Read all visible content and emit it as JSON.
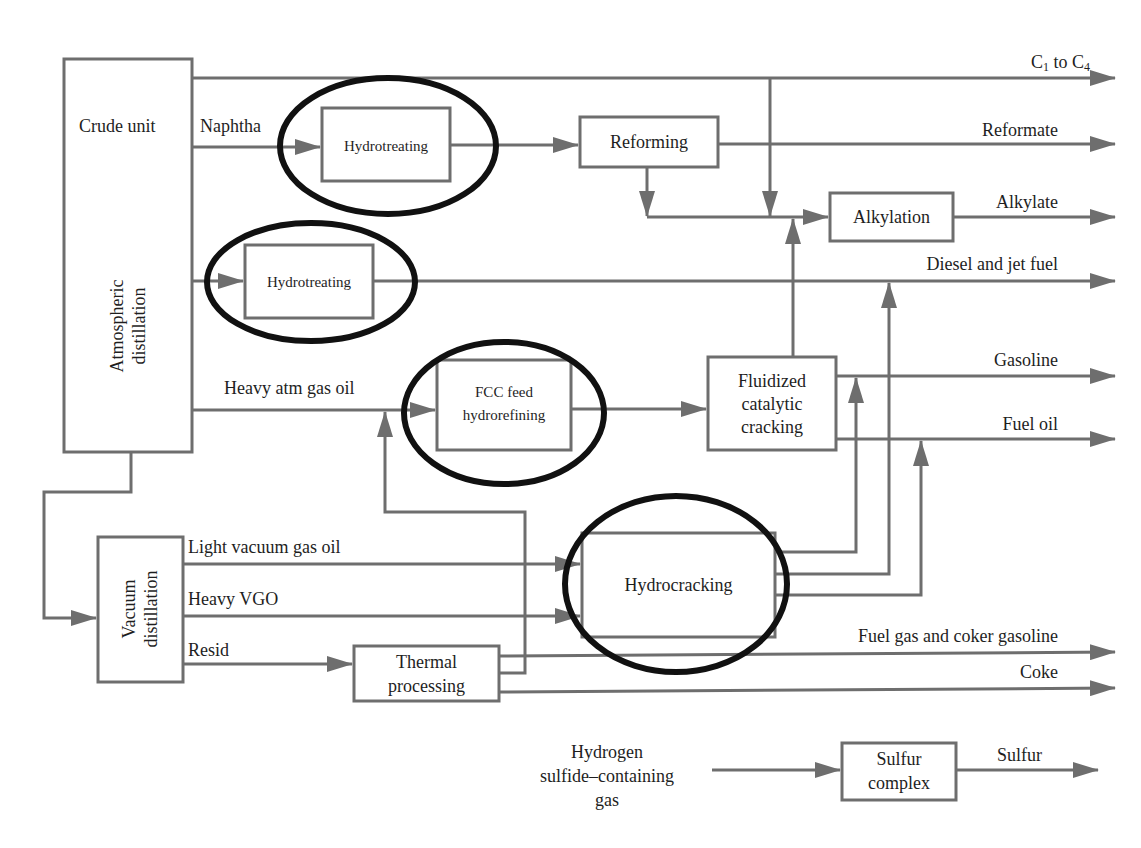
{
  "diagram": {
    "type": "process-flow",
    "units": {
      "crude_unit": {
        "label": "Crude unit",
        "sublabel_line1": "Atmospheric",
        "sublabel_line2": "distillation"
      },
      "hydrotreating_naphtha": {
        "label": "Hydrotreating",
        "circled": true
      },
      "reforming": {
        "label": "Reforming"
      },
      "alkylation": {
        "label": "Alkylation"
      },
      "hydrotreating_distillate": {
        "label": "Hydrotreating",
        "circled": true
      },
      "fcc_feed": {
        "line1": "FCC feed",
        "line2": "hydrorefining",
        "circled": true
      },
      "fcc": {
        "line1": "Fluidized",
        "line2": "catalytic",
        "line3": "cracking"
      },
      "vacuum": {
        "line1": "Vacuum",
        "line2": "distillation"
      },
      "hydrocracking": {
        "label": "Hydrocracking",
        "circled": true
      },
      "thermal": {
        "line1": "Thermal",
        "line2": "processing"
      },
      "sulfur": {
        "line1": "Sulfur",
        "line2": "complex"
      }
    },
    "streams": {
      "naphtha": "Naphtha",
      "heavy_atm_gas_oil": "Heavy atm gas oil",
      "light_vgo": "Light vacuum gas oil",
      "heavy_vgo": "Heavy VGO",
      "resid": "Resid",
      "h2s_line1": "Hydrogen",
      "h2s_line2": "sulfide–containing",
      "h2s_line3": "gas"
    },
    "products": {
      "c1_c4_prefix": "C",
      "c1_c4_sub1": "1",
      "c1_c4_mid": " to C",
      "c1_c4_sub2": "4",
      "reformate": "Reformate",
      "alkylate": "Alkylate",
      "diesel_jet": "Diesel and jet fuel",
      "gasoline": "Gasoline",
      "fuel_oil": "Fuel oil",
      "fuel_gas_coker": "Fuel gas and coker gasoline",
      "coke": "Coke",
      "sulfur": "Sulfur"
    },
    "colors": {
      "line": "#6e6e6e",
      "box_border": "#6e6e6e",
      "highlight_ellipse": "#111111",
      "background": "#ffffff"
    }
  }
}
